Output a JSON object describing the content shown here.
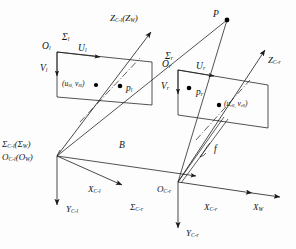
{
  "figure": {
    "type": "technical-diagram",
    "background_color": "#fdfdfd",
    "line_color": "#1a1a1a",
    "point_color": "#000000"
  },
  "points": {
    "scene_point": "P",
    "left_image_point": "p",
    "left_image_point_sub": "l",
    "right_image_point": "p",
    "right_image_point_sub": "r"
  },
  "left_camera": {
    "frame_label": "Σ",
    "frame_sub": "l",
    "origin_label": "O",
    "origin_sub": "l",
    "u_axis": "U",
    "u_axis_sub": "l",
    "v_axis": "V",
    "v_axis_sub": "l",
    "principal_point": "(u",
    "principal_point_sub1": "l0,",
    "principal_point_mid": " v",
    "principal_point_sub2": "l0",
    "principal_point_end": ")",
    "cam_frame": "Σ",
    "cam_frame_sub": "C-l",
    "cam_frame_world": "(Σ",
    "cam_frame_world_sub": "W",
    "cam_frame_world_end": ")",
    "cam_origin": "O",
    "cam_origin_sub": "C-l",
    "cam_origin_world": "(O",
    "cam_origin_world_sub": "W",
    "cam_origin_world_end": ")",
    "x_axis": "X",
    "x_axis_sub": "C-l",
    "y_axis": "Y",
    "y_axis_sub": "C-l",
    "z_axis": "Z",
    "z_axis_sub": "C-l",
    "z_axis_world": "(Z",
    "z_axis_world_sub": "W",
    "z_axis_world_end": ")"
  },
  "right_camera": {
    "frame_label": "Σ",
    "frame_sub": "r",
    "origin_label": "O",
    "origin_sub": "r",
    "u_axis": "U",
    "u_axis_sub": "r",
    "v_axis": "V",
    "v_axis_sub": "r",
    "principal_point": "(u",
    "principal_point_sub1": "r0,",
    "principal_point_mid": " v",
    "principal_point_sub2": "r0",
    "principal_point_end": ")",
    "cam_frame": "Σ",
    "cam_frame_sub": "C-r",
    "cam_origin": "O",
    "cam_origin_sub": "C-r",
    "x_axis": "X",
    "x_axis_sub": "C-r",
    "y_axis": "Y",
    "y_axis_sub": "C-r",
    "z_axis": "Z",
    "z_axis_sub": "C-r"
  },
  "world": {
    "x_axis": "X",
    "x_axis_sub": "W"
  },
  "measures": {
    "baseline": "B",
    "focal_length": "f"
  }
}
